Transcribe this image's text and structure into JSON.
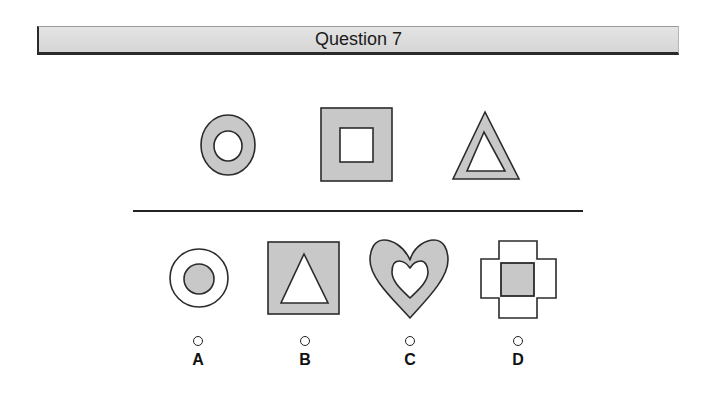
{
  "header": {
    "title": "Question 7"
  },
  "colors": {
    "fill_gray": "#c8c8c8",
    "stroke": "#2b2b2b",
    "background": "#ffffff",
    "header_bg": "#dedede"
  },
  "prompt_shapes": [
    {
      "name": "circle-ring",
      "description": "gray ring with white circular hole"
    },
    {
      "name": "square-frame",
      "description": "gray square with white square hole"
    },
    {
      "name": "triangle-frame",
      "description": "gray triangle with white triangular hole"
    }
  ],
  "options": [
    {
      "letter": "A",
      "description": "white ring with gray filled inner circle"
    },
    {
      "letter": "B",
      "description": "gray square with white triangle inside"
    },
    {
      "letter": "C",
      "description": "gray heart with white heart hole"
    },
    {
      "letter": "D",
      "description": "white cross outline with gray square in center"
    }
  ]
}
